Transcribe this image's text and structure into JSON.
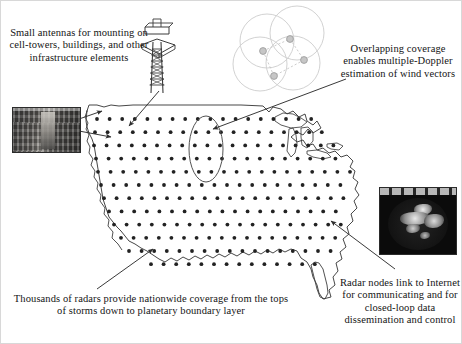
{
  "captions": {
    "antennas": "Small antennas for mounting on cell-towers, buildings, and other infrastructure elements",
    "overlapping": "Overlapping coverage enables multiple-Doppler estimation of wind vectors",
    "thousands": "Thousands of radars provide nationwide coverage from the tops of storms down to planetary boundary layer",
    "internet": "Radar nodes link to Internet for communicating and for closed-loop data dissemination and control"
  },
  "insets": {
    "building_photo_alt": "Photograph of a brick building with a rooftop-mounted antenna",
    "radar_photo_alt": "Radar reflectivity image showing storm cells on a dark display"
  },
  "graphics": {
    "cell_tower_alt": "Line drawing of a lattice cell tower with a mounted antenna",
    "highlight_ellipse_alt": "Ellipse highlighting a column of radar nodes",
    "coverage_circles_alt": "Four overlapping coverage circles with four radar nodes linked by dashed lines"
  },
  "colors": {
    "ink": "#141414",
    "map_outline": "#3a3a3a",
    "node_dot": "#2a2a2a",
    "coverage_circle": "#cfcfcf",
    "coverage_node": "#b5b5b5",
    "background": "#ffffff"
  },
  "radar_grid": {
    "description": "Regular lattice of radar node dots covering the contiguous United States",
    "dot_spacing_x_px": 12.6,
    "dot_spacing_y_px": 13.2,
    "dot_radius_px": 1.9,
    "origin_x_px": 92,
    "origin_y_px": 118,
    "columns": 24,
    "rows": 12
  },
  "coverage_diagram": {
    "circle_radius_px": 27,
    "circles": [
      {
        "cx": 266,
        "cy": 40
      },
      {
        "cx": 296,
        "cy": 32
      },
      {
        "cx": 259,
        "cy": 63
      },
      {
        "cx": 292,
        "cy": 62
      }
    ],
    "nodes": [
      {
        "cx": 262,
        "cy": 50
      },
      {
        "cx": 289,
        "cy": 38
      },
      {
        "cx": 303,
        "cy": 59
      },
      {
        "cx": 273,
        "cy": 75
      }
    ],
    "links": [
      [
        0,
        1
      ],
      [
        1,
        2
      ],
      [
        2,
        3
      ],
      [
        3,
        0
      ]
    ]
  },
  "annotations": {
    "arrows": [
      {
        "name": "arrow-to-tower-node",
        "x1": 156,
        "y1": 88,
        "x2": 127,
        "y2": 124
      },
      {
        "name": "arrow-to-building-node",
        "x1": 78,
        "y1": 117,
        "x2": 104,
        "y2": 108
      },
      {
        "name": "arrow-to-building-node2",
        "x1": 78,
        "y1": 128,
        "x2": 109,
        "y2": 134
      },
      {
        "name": "arrow-to-highlight",
        "x1": 344,
        "y1": 77,
        "x2": 208,
        "y2": 126
      },
      {
        "name": "arrow-to-map-bottom",
        "x1": 96,
        "y1": 288,
        "x2": 152,
        "y2": 248
      },
      {
        "name": "arrow-to-east-node",
        "x1": 392,
        "y1": 268,
        "x2": 330,
        "y2": 219
      }
    ]
  }
}
